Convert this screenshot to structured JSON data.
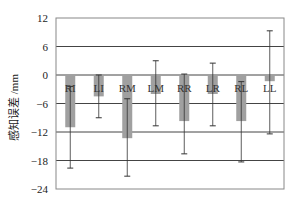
{
  "chart_data": {
    "type": "bar",
    "title": "",
    "xlabel": "",
    "ylabel": "感知误差 /mm",
    "ylim": [
      -24,
      12
    ],
    "yticks": [
      12,
      6,
      0,
      -6,
      -12,
      -18,
      -24
    ],
    "grid": true,
    "legend": null,
    "categories": [
      "RI",
      "LI",
      "RM",
      "LM",
      "RR",
      "LR",
      "RL",
      "LL"
    ],
    "values": [
      -11.0,
      -4.5,
      -13.3,
      -4.0,
      -9.7,
      -4.0,
      -9.7,
      -1.3
    ],
    "error_upper": [
      -2.4,
      0.0,
      -5.0,
      3.0,
      0.2,
      2.5,
      -1.4,
      9.3
    ],
    "error_lower": [
      -19.6,
      -9.0,
      -21.3,
      -10.7,
      -16.6,
      -10.7,
      -18.3,
      -12.4
    ],
    "bar_color": "#a0a0a0",
    "grid_color": "#444444",
    "frame_color": "#888888"
  }
}
